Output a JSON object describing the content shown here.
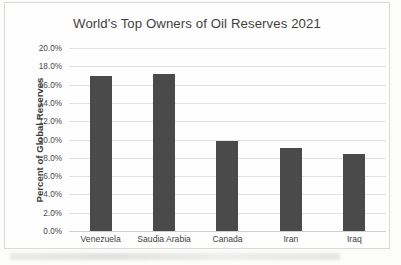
{
  "chart_data": {
    "type": "bar",
    "title": "World's Top Owners of Oil Reserves 2021",
    "xlabel": "",
    "ylabel": "Percent of Global Reserves",
    "categories": [
      "Venezuela",
      "Saudia Arabia",
      "Canada",
      "Iran",
      "Iraq"
    ],
    "values": [
      16.9,
      17.2,
      9.8,
      9.1,
      8.4
    ],
    "value_suffix": "%",
    "ylim": [
      0.0,
      20.0
    ],
    "ytick_step": 2.0,
    "ytick_labels": [
      "20.0%",
      "18.0%",
      "16.0%",
      "14.0%",
      "12.0%",
      "10.0%",
      "8.0%",
      "6.0%",
      "4.0%",
      "2.0%",
      "0.0%"
    ],
    "ytick_values": [
      20.0,
      18.0,
      16.0,
      14.0,
      12.0,
      10.0,
      8.0,
      6.0,
      4.0,
      2.0,
      0.0
    ],
    "grid": true,
    "grid_orientation": "horizontal",
    "legend": false,
    "legend_position": "none",
    "bar_color": "#4a4a4a",
    "gridline_color": "#e2e2e0",
    "text_color": "#3f3f3f",
    "background_color": "#fefefe",
    "border_color": "#d9d9d6"
  }
}
